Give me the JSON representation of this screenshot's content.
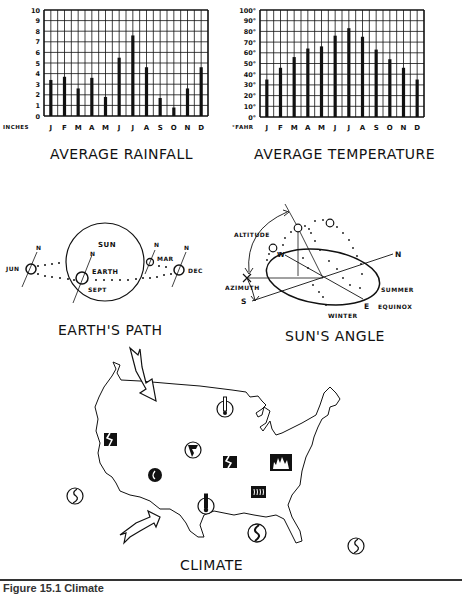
{
  "chart_data": [
    {
      "type": "bar",
      "title": "AVERAGE RAINFALL",
      "xlabel": "",
      "ylabel": "INCHES",
      "categories": [
        "J",
        "F",
        "M",
        "A",
        "M",
        "J",
        "J",
        "A",
        "S",
        "O",
        "N",
        "D"
      ],
      "values": [
        3.4,
        3.7,
        2.6,
        3.6,
        1.8,
        5.5,
        7.6,
        4.6,
        1.7,
        0.8,
        2.6,
        4.6
      ],
      "ylim": [
        0,
        10
      ],
      "yticks": [
        "0",
        "1",
        "2",
        "3",
        "4",
        "5",
        "6",
        "7",
        "8",
        "9",
        "10"
      ],
      "grid": true
    },
    {
      "type": "bar",
      "title": "AVERAGE TEMPERATURE",
      "xlabel": "",
      "ylabel": "°FAHR",
      "categories": [
        "J",
        "F",
        "M",
        "A",
        "M",
        "J",
        "J",
        "A",
        "S",
        "O",
        "N",
        "D"
      ],
      "values": [
        35,
        46,
        56,
        64,
        66,
        76,
        83,
        75,
        63,
        54,
        46,
        35
      ],
      "ylim": [
        0,
        100
      ],
      "yticks": [
        "0°",
        "10°",
        "20°",
        "30°",
        "40°",
        "50°",
        "60°",
        "70°",
        "80°",
        "90°",
        "100°"
      ],
      "grid": true
    }
  ],
  "rainfall": {
    "title": "AVERAGE RAINFALL",
    "unit": "INCHES",
    "months": [
      "J",
      "F",
      "M",
      "A",
      "M",
      "J",
      "J",
      "A",
      "S",
      "O",
      "N",
      "D"
    ],
    "yticks": [
      "0",
      "1",
      "2",
      "3",
      "4",
      "5",
      "6",
      "7",
      "8",
      "9",
      "10"
    ]
  },
  "temperature": {
    "title": "AVERAGE TEMPERATURE",
    "unit": "°FAHR",
    "months": [
      "J",
      "F",
      "M",
      "A",
      "M",
      "J",
      "J",
      "A",
      "S",
      "O",
      "N",
      "D"
    ],
    "yticks": [
      "0°",
      "10°",
      "20°",
      "30°",
      "40°",
      "50°",
      "60°",
      "70°",
      "80°",
      "90°",
      "100°"
    ]
  },
  "earth_path": {
    "title": "EARTH'S PATH",
    "sun_label": "SUN",
    "earth_label": "EARTH",
    "north_label": "N",
    "positions": [
      "JUN",
      "SEPT",
      "MAR",
      "DEC"
    ]
  },
  "sun_angle": {
    "title": "SUN'S ANGLE",
    "labels": {
      "altitude": "ALTITUDE",
      "azimuth": "AZIMUTH",
      "north": "N",
      "south": "S",
      "east": "E",
      "west": "W",
      "summer": "SUMMER",
      "equinox": "EQUINOX",
      "winter": "WINTER"
    }
  },
  "climate_map": {
    "title": "CLIMATE",
    "icons": [
      "cold-front-arrow",
      "warm-front-arrow",
      "thermometer-cold",
      "thermometer-hot",
      "earthquake",
      "tornado",
      "drought",
      "fire",
      "humidity",
      "hurricane"
    ]
  },
  "caption": "Figure 15.1  Climate"
}
